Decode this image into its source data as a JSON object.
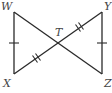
{
  "diagram": {
    "type": "geometry",
    "points": {
      "W": "W",
      "X": "X",
      "Y": "Y",
      "Z": "Z",
      "T": "T"
    },
    "segments": [
      "WX",
      "YZ",
      "WZ",
      "XY"
    ],
    "congruence_marks": [
      {
        "segments": [
          "WX",
          "YZ"
        ],
        "ticks": 1
      },
      {
        "segments": [
          "XT",
          "TY"
        ],
        "ticks": 2
      }
    ]
  }
}
